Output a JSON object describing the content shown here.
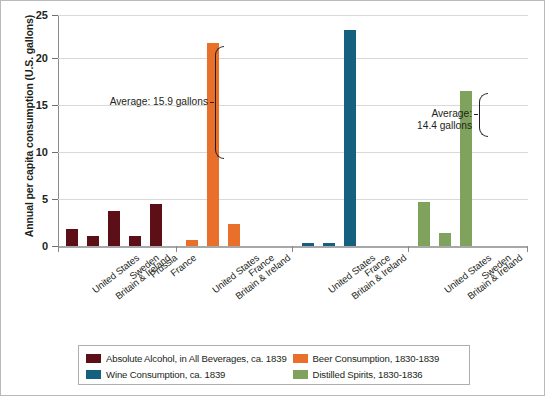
{
  "chart_data": {
    "type": "bar",
    "title": "",
    "xlabel": "",
    "ylabel": "Annual per capita consumption (U.S. gallons)",
    "ylim": [
      0,
      25
    ],
    "yticks": [
      0,
      5,
      10,
      15,
      20,
      25
    ],
    "grid": true,
    "legend_position": "bottom",
    "groups": [
      {
        "series_name": "Absolute Alcohol, in All Beverages, ca. 1839",
        "color": "#5c0f16",
        "categories": [
          "United States",
          "Britain & Ireland",
          "Sweden",
          "Prussia",
          "France"
        ],
        "values": [
          1.8,
          1.1,
          3.8,
          1.1,
          4.6
        ]
      },
      {
        "series_name": "Beer Consumption, 1830-1839",
        "color": "#e8702a",
        "categories": [
          "United States",
          "Britain & Ireland",
          "France"
        ],
        "values": [
          0.6,
          22.0,
          2.4
        ],
        "annotation": {
          "label_line1": "Average: 15.9 gallons",
          "label_line2": "",
          "value": 15.9
        }
      },
      {
        "series_name": "Wine Consumption, ca. 1839",
        "color": "#16607f",
        "categories": [
          "United States",
          "Britain & Ireland",
          "France"
        ],
        "values": [
          0.3,
          0.35,
          23.4
        ]
      },
      {
        "series_name": "Distilled Spirits, 1830-1836",
        "color": "#7fa35d",
        "categories": [
          "United States",
          "Britain & Ireland",
          "Sweden"
        ],
        "values": [
          4.8,
          1.4,
          16.8
        ],
        "annotation": {
          "label_line1": "Average:",
          "label_line2": "14.4 gallons",
          "value": 14.4
        }
      }
    ],
    "annotations": [
      {
        "text": "Average: 15.9 gallons",
        "value": 15.9,
        "series": "Beer Consumption, 1830-1839"
      },
      {
        "text": "Average: 14.4 gallons",
        "value": 14.4,
        "series": "Distilled Spirits, 1830-1836"
      }
    ]
  },
  "axis": {
    "y_title": "Annual per capita consumption (U.S. gallons)",
    "y_ticks": [
      "25",
      "20",
      "15",
      "10",
      "5",
      "0"
    ]
  },
  "legend": {
    "items": [
      {
        "label": "Absolute Alcohol, in All Beverages, ca. 1839",
        "color": "#5c0f16"
      },
      {
        "label": "Beer Consumption, 1830-1839",
        "color": "#e8702a"
      },
      {
        "label": "Wine Consumption, ca. 1839",
        "color": "#16607f"
      },
      {
        "label": "Distilled Spirits, 1830-1836",
        "color": "#7fa35d"
      }
    ]
  },
  "annotation_left": {
    "line1": "Average: 15.9 gallons",
    "line2": ""
  },
  "annotation_right": {
    "line1": "Average:",
    "line2": "14.4 gallons"
  },
  "xlabels": {
    "g0": [
      "United States",
      "Britain & Ireland",
      "Sweden",
      "Prussia",
      "France"
    ],
    "g1": [
      "United States",
      "Britain & Ireland",
      "France"
    ],
    "g2": [
      "United States",
      "Britain & Ireland",
      "France"
    ],
    "g3": [
      "United States",
      "Britain & Ireland",
      "Sweden"
    ]
  }
}
